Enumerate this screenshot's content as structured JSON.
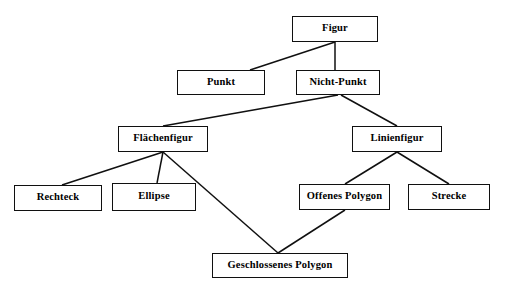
{
  "diagram": {
    "type": "hierarchy-tree",
    "background_color": "#ffffff",
    "line_color": "#101010",
    "text_color": "#000000",
    "nodes": [
      {
        "id": "figur",
        "label": "Figur",
        "x": 292,
        "y": 16,
        "w": 86,
        "h": 26
      },
      {
        "id": "punkt",
        "label": "Punkt",
        "x": 177,
        "y": 70,
        "w": 88,
        "h": 25
      },
      {
        "id": "nicht_punkt",
        "label": "Nicht-Punkt",
        "x": 296,
        "y": 70,
        "w": 84,
        "h": 25
      },
      {
        "id": "flaechenfigur",
        "label": "Flächenfigur",
        "x": 118,
        "y": 126,
        "w": 90,
        "h": 26
      },
      {
        "id": "linienfigur",
        "label": "Linienfigur",
        "x": 352,
        "y": 126,
        "w": 90,
        "h": 26
      },
      {
        "id": "rechteck",
        "label": "Rechteck",
        "x": 14,
        "y": 185,
        "w": 88,
        "h": 26
      },
      {
        "id": "ellipse",
        "label": "Ellipse",
        "x": 112,
        "y": 183,
        "w": 84,
        "h": 28
      },
      {
        "id": "offenes_polygon",
        "label": "Offenes Polygon",
        "x": 299,
        "y": 184,
        "w": 91,
        "h": 26
      },
      {
        "id": "strecke",
        "label": "Strecke",
        "x": 408,
        "y": 184,
        "w": 82,
        "h": 26
      },
      {
        "id": "geschlossenes_polygon",
        "label": "Geschlossenes Polygon",
        "x": 212,
        "y": 253,
        "w": 136,
        "h": 25
      }
    ],
    "edges": [
      {
        "from": "figur",
        "to": "punkt",
        "x1": 335,
        "y1": 42,
        "x2": 250,
        "y2": 70
      },
      {
        "from": "figur",
        "to": "nicht_punkt",
        "x1": 335,
        "y1": 42,
        "x2": 335,
        "y2": 70
      },
      {
        "from": "nicht_punkt",
        "to": "flaechenfigur",
        "x1": 338,
        "y1": 95,
        "x2": 163,
        "y2": 126
      },
      {
        "from": "nicht_punkt",
        "to": "linienfigur",
        "x1": 341,
        "y1": 95,
        "x2": 397,
        "y2": 126
      },
      {
        "from": "flaechenfigur",
        "to": "rechteck",
        "x1": 163,
        "y1": 152,
        "x2": 62,
        "y2": 185
      },
      {
        "from": "flaechenfigur",
        "to": "ellipse",
        "x1": 163,
        "y1": 152,
        "x2": 157,
        "y2": 183
      },
      {
        "from": "flaechenfigur",
        "to": "geschlossenes_polygon",
        "x1": 163,
        "y1": 152,
        "x2": 278,
        "y2": 253
      },
      {
        "from": "linienfigur",
        "to": "offenes_polygon",
        "x1": 397,
        "y1": 152,
        "x2": 345,
        "y2": 184
      },
      {
        "from": "linienfigur",
        "to": "strecke",
        "x1": 397,
        "y1": 152,
        "x2": 449,
        "y2": 184
      },
      {
        "from": "offenes_polygon",
        "to": "geschlossenes_polygon",
        "x1": 345,
        "y1": 210,
        "x2": 278,
        "y2": 253
      }
    ]
  }
}
